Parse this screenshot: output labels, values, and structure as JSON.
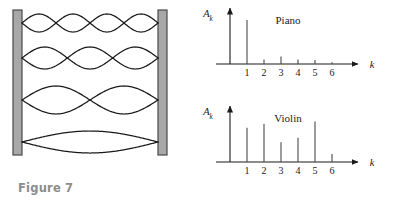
{
  "figure7": {
    "caption": "Figure 7",
    "description": "Standing waves on a string fixed between two walls",
    "wall_color": "#a8a8a8",
    "wall_border": "#4a4a4a",
    "curve_color": "#1a1a1a",
    "modes": [
      {
        "harmonic": 4,
        "lobes": 4,
        "amplitude": 9
      },
      {
        "harmonic": 3,
        "lobes": 3,
        "amplitude": 11
      },
      {
        "harmonic": 2,
        "lobes": 2,
        "amplitude": 14
      },
      {
        "harmonic": 1,
        "lobes": 1,
        "amplitude": 11
      }
    ]
  },
  "figure8": {
    "caption": "Figure 8",
    "axis_color": "#1a1a1a",
    "bar_color": "#4a4a4a",
    "chart_data": [
      {
        "type": "bar",
        "title": "Piano",
        "xlabel": "k",
        "ylabel": "A_k",
        "ylabel_base": "A",
        "ylabel_sub": "k",
        "categories": [
          "1",
          "2",
          "3",
          "4",
          "5",
          "6"
        ],
        "x": [
          1,
          2,
          3,
          4,
          5,
          6
        ],
        "values": [
          1.0,
          0.1,
          0.17,
          0.1,
          0.09,
          0.04
        ],
        "ylim": [
          0,
          1.1
        ],
        "xlim": [
          0,
          7
        ],
        "grid": false,
        "legend": "none"
      },
      {
        "type": "bar",
        "title": "Violin",
        "xlabel": "k",
        "ylabel": "A_k",
        "ylabel_base": "A",
        "ylabel_sub": "k",
        "categories": [
          "1",
          "2",
          "3",
          "4",
          "5",
          "6"
        ],
        "x": [
          1,
          2,
          3,
          4,
          5,
          6
        ],
        "values": [
          0.78,
          0.87,
          0.45,
          0.55,
          0.92,
          0.18
        ],
        "ylim": [
          0,
          1.1
        ],
        "xlim": [
          0,
          7
        ],
        "grid": false,
        "legend": "none"
      }
    ]
  }
}
